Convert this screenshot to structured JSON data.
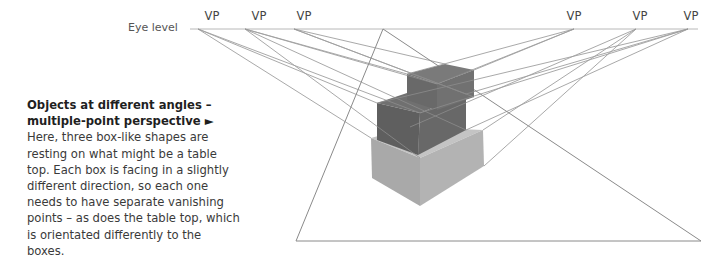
{
  "caption": {
    "title_line1": "Objects at different angles –",
    "title_line2": "multiple-point perspective ►",
    "body": "Here, three box-like shapes are resting on what might be a table top. Each box is facing in a slightly different direction, so each one needs to have separate vanishing points – as does the table top, which is orientated differently to the boxes."
  },
  "diagram": {
    "eye_level_label": "Eye level",
    "vanishing_points": [
      {
        "label": "VP",
        "x": 198
      },
      {
        "label": "VP",
        "x": 245
      },
      {
        "label": "VP",
        "x": 294
      },
      {
        "label": "VP",
        "x": 574
      },
      {
        "label": "VP",
        "x": 636
      },
      {
        "label": "VP",
        "x": 688
      }
    ],
    "colors": {
      "line": "#9a9a9a",
      "box_top_dark": "#6c6c6c",
      "box_middle_dark": "#5e5e5e",
      "box_bottom_light": "#a8a8a8"
    }
  }
}
